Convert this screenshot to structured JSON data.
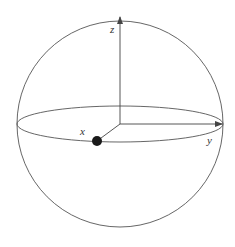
{
  "diagram": {
    "type": "bloch-sphere",
    "labels": {
      "z": "z",
      "x": "x",
      "y": "y"
    },
    "colors": {
      "line": "#444444",
      "point": "#1a1a1a",
      "background": "#ffffff"
    },
    "state_point": {
      "description": "point on x-axis at sphere surface"
    }
  }
}
